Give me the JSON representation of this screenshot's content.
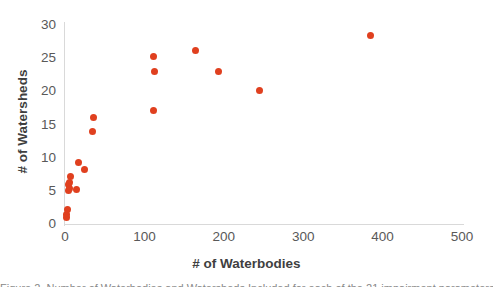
{
  "chart_data": {
    "type": "scatter",
    "title": "",
    "xlabel": "# of Waterbodies",
    "ylabel": "# of Watersheds",
    "xlim": [
      0,
      500
    ],
    "ylim": [
      0,
      30
    ],
    "xticks": [
      0,
      100,
      200,
      300,
      400,
      500
    ],
    "yticks": [
      0,
      5,
      10,
      15,
      20,
      25,
      30
    ],
    "grid": false,
    "legend": false,
    "marker_color": "#e0401f",
    "axis_color": "#d9d9d9",
    "tick_label_color": "#595959",
    "axis_title_color": "#3f3f3f",
    "points": [
      {
        "x": 2,
        "y": 1.5
      },
      {
        "x": 2,
        "y": 1.0
      },
      {
        "x": 3,
        "y": 2.2
      },
      {
        "x": 5,
        "y": 5.0
      },
      {
        "x": 6,
        "y": 5.3
      },
      {
        "x": 5,
        "y": 5.9
      },
      {
        "x": 6,
        "y": 6.3
      },
      {
        "x": 7,
        "y": 7.2
      },
      {
        "x": 14,
        "y": 5.2
      },
      {
        "x": 17,
        "y": 9.2
      },
      {
        "x": 25,
        "y": 8.2
      },
      {
        "x": 36,
        "y": 16.1
      },
      {
        "x": 35,
        "y": 14.0
      },
      {
        "x": 112,
        "y": 25.2
      },
      {
        "x": 113,
        "y": 23.0
      },
      {
        "x": 111,
        "y": 17.1
      },
      {
        "x": 164,
        "y": 26.1
      },
      {
        "x": 193,
        "y": 23.0
      },
      {
        "x": 245,
        "y": 20.2
      },
      {
        "x": 385,
        "y": 28.4
      }
    ]
  },
  "caption": {
    "text": "Figure 2. Number of Waterbodies and Watersheds Included for each of the 21 impairment parameters"
  }
}
